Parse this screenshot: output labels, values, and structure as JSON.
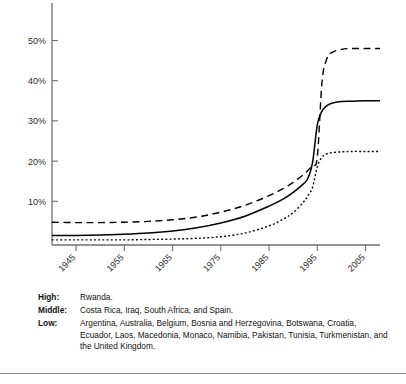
{
  "chart_data": {
    "type": "line",
    "title": "",
    "xlabel": "",
    "ylabel": "",
    "xlim": [
      1940,
      2008
    ],
    "ylim": [
      0,
      57
    ],
    "grid": false,
    "legend_position": "below-as-caption",
    "x_ticks": [
      1945,
      1955,
      1965,
      1975,
      1985,
      1995,
      2005
    ],
    "x_tick_labels": [
      "1945",
      "1955",
      "1965",
      "1975",
      "1985",
      "1995",
      "2005"
    ],
    "y_ticks": [
      10,
      20,
      30,
      40,
      50
    ],
    "y_tick_labels": [
      "10%",
      "20%",
      "30%",
      "40%",
      "50%"
    ],
    "x": [
      1940,
      1945,
      1950,
      1955,
      1960,
      1965,
      1970,
      1975,
      1980,
      1985,
      1988,
      1990,
      1992,
      1993,
      1994,
      1995,
      1996,
      1997,
      1998,
      2000,
      2002,
      2005,
      2008
    ],
    "series": [
      {
        "name": "High",
        "style": "dashed",
        "color": "#000000",
        "values": [
          4.8,
          4.7,
          4.7,
          4.8,
          5.0,
          5.4,
          6.1,
          7.3,
          9.0,
          11.4,
          13.2,
          14.7,
          16.5,
          17.6,
          19.0,
          21.0,
          40.0,
          45.5,
          47.0,
          47.8,
          48.0,
          48.0,
          48.0
        ]
      },
      {
        "name": "Middle",
        "style": "solid",
        "color": "#000000",
        "values": [
          1.5,
          1.5,
          1.6,
          1.8,
          2.1,
          2.6,
          3.4,
          4.6,
          6.3,
          8.8,
          10.6,
          12.2,
          14.2,
          15.6,
          19.5,
          29.0,
          32.5,
          33.8,
          34.4,
          34.8,
          34.9,
          35.0,
          35.0
        ]
      },
      {
        "name": "Low",
        "style": "dotted",
        "color": "#000000",
        "values": [
          0.4,
          0.4,
          0.4,
          0.4,
          0.5,
          0.6,
          0.8,
          1.2,
          2.1,
          3.9,
          5.6,
          7.2,
          9.6,
          11.3,
          13.4,
          18.6,
          21.0,
          21.8,
          22.1,
          22.3,
          22.4,
          22.4,
          22.4
        ]
      }
    ]
  },
  "caption": {
    "rows": [
      {
        "label": "High:",
        "value": "Rwanda."
      },
      {
        "label": "Middle:",
        "value": "Costa Rica, Iraq, South Africa, and Spain."
      },
      {
        "label": "Low:",
        "value": "Argentina, Australia, Belgium, Bosnia and Herzegovina, Botswana, Croatia, Ecuador, Laos, Macedonia, Monaco, Namibia, Pakistan, Tunisia, Turkmenistan, and the United Kingdom."
      }
    ]
  }
}
